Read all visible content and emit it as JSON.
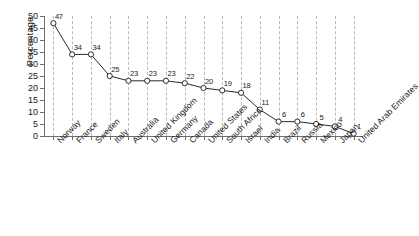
{
  "chart_data": {
    "type": "line",
    "title": "",
    "subtitle": "",
    "xlabel": "",
    "ylabel": "Percentage",
    "ylim": [
      0,
      50
    ],
    "yticks": [
      0,
      5,
      10,
      15,
      20,
      25,
      30,
      35,
      40,
      45,
      50
    ],
    "grid": "vertical-dashed",
    "legend": "none",
    "marker": "open-circle",
    "line_color": "#2b2b2b",
    "marker_face": "#ffffff",
    "grid_color": "#b9b9b9",
    "axis_color": "#6d6d6d",
    "categories": [
      "Norway",
      "France",
      "Sweden",
      "Italy",
      "Australia",
      "United Kingdom",
      "Germany",
      "Canada",
      "United States",
      "South Africa",
      "Israel",
      "India",
      "Brazil",
      "Russia",
      "Mexico",
      "Japan",
      "United Arab Emirates"
    ],
    "values": [
      47,
      34,
      34,
      25,
      23,
      23,
      23,
      22,
      20,
      19,
      18,
      11,
      6,
      6,
      5,
      4,
      1
    ],
    "data_labels": [
      "47",
      "34",
      "34",
      "25",
      "23",
      "23",
      "23",
      "22",
      "20",
      "19",
      "18",
      "11",
      "6",
      "6",
      "5",
      "4",
      "1"
    ]
  }
}
